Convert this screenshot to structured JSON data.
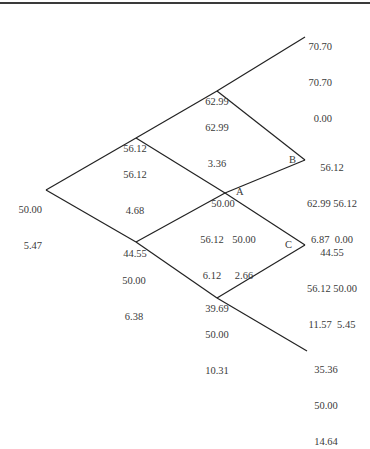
{
  "diagram": {
    "type": "binomial-tree",
    "nodes": {
      "root": {
        "lines": [
          "50.00",
          "5.47"
        ]
      },
      "up1_above": {
        "lines": [
          "56.12"
        ]
      },
      "up1_below": {
        "lines": [
          "56.12",
          "4.68"
        ]
      },
      "down1_above": {
        "lines": [
          "44.55"
        ]
      },
      "down1_below": {
        "lines": [
          "50.00",
          "6.38"
        ]
      },
      "up2_above": {
        "lines": [
          "62.99"
        ]
      },
      "up2_below": {
        "lines": [
          "62.99",
          "3.36"
        ]
      },
      "mid_above": {
        "lines": [
          "50.00"
        ]
      },
      "mid_below_left": {
        "lines": [
          "56.12",
          "6.12"
        ]
      },
      "mid_below_right": {
        "lines": [
          "50.00",
          "2.66"
        ]
      },
      "down2_above": {
        "lines": [
          "39.69"
        ]
      },
      "down2_below": {
        "lines": [
          "50.00",
          "10.31"
        ]
      },
      "top_leaf": {
        "lines": [
          "70.70",
          "70.70",
          "0.00"
        ]
      },
      "b_leaf": {
        "lines": [
          "56.12",
          "62.99 56.12",
          "6.87  0.00"
        ]
      },
      "c_leaf": {
        "lines": [
          "44.55",
          "56.12 50.00",
          "11.57  5.45"
        ]
      },
      "bottom_leaf": {
        "lines": [
          "35.36",
          "50.00",
          "14.64"
        ]
      }
    },
    "letters": {
      "a": "A",
      "b": "B",
      "c": "C"
    }
  }
}
